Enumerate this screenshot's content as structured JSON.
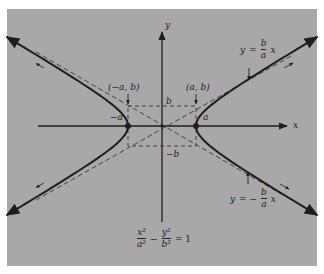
{
  "figure": {
    "panel_color": "#a8a8a8",
    "ink_color": "#1e1e1e",
    "axes": {
      "x_label": "x",
      "y_label": "y"
    },
    "points": {
      "left_vertex_label": "−a",
      "right_vertex_label": "a",
      "top_label": "b",
      "bottom_label": "−b",
      "corner_left": "(−a, b)",
      "corner_right": "(a, b)"
    },
    "asymptotes": {
      "upper": {
        "lhs": "y",
        "eq": "=",
        "num": "b",
        "den": "a",
        "var": "x"
      },
      "lower": {
        "lhs": "y",
        "eq": "= −",
        "num": "b",
        "den": "a",
        "var": "x"
      }
    },
    "equation": {
      "t1_num": "x²",
      "t1_den": "a²",
      "minus": "−",
      "t2_num": "y²",
      "t2_den": "b²",
      "rhs": "= 1"
    }
  }
}
